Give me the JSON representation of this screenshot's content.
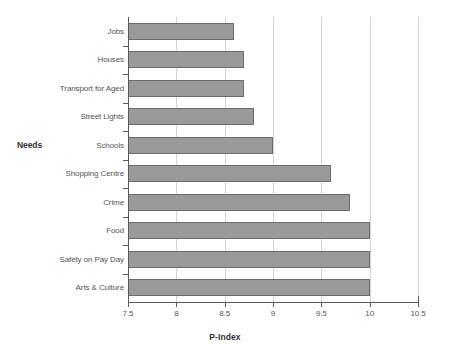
{
  "chart_data": {
    "type": "bar",
    "orientation": "horizontal",
    "title": "",
    "xlabel": "P-Index",
    "ylabel": "Needs",
    "categories": [
      "Jobs",
      "Houses",
      "Transport for Aged",
      "Street Lights",
      "Schools",
      "Shopping Centre",
      "Crime",
      "Food",
      "Safety on Pay Day",
      "Arts & Culture"
    ],
    "values": [
      8.6,
      8.7,
      8.7,
      8.8,
      9.0,
      9.6,
      9.8,
      10.0,
      10.0,
      10.0
    ],
    "xlim": [
      7.5,
      10.5
    ],
    "xticks": [
      7.5,
      8,
      8.5,
      9,
      9.5,
      10,
      10.5
    ],
    "xtick_labels": [
      "7.5",
      "8",
      "8.5",
      "9",
      "9.5",
      "10",
      "10.5"
    ],
    "grid": "vertical",
    "legend": "none",
    "bar_fill_color": "#9a9a9a",
    "bar_border_color": "#6b6b6b",
    "gridline_color": "#d3d3d3",
    "axis_color": "#5a5a5a"
  }
}
